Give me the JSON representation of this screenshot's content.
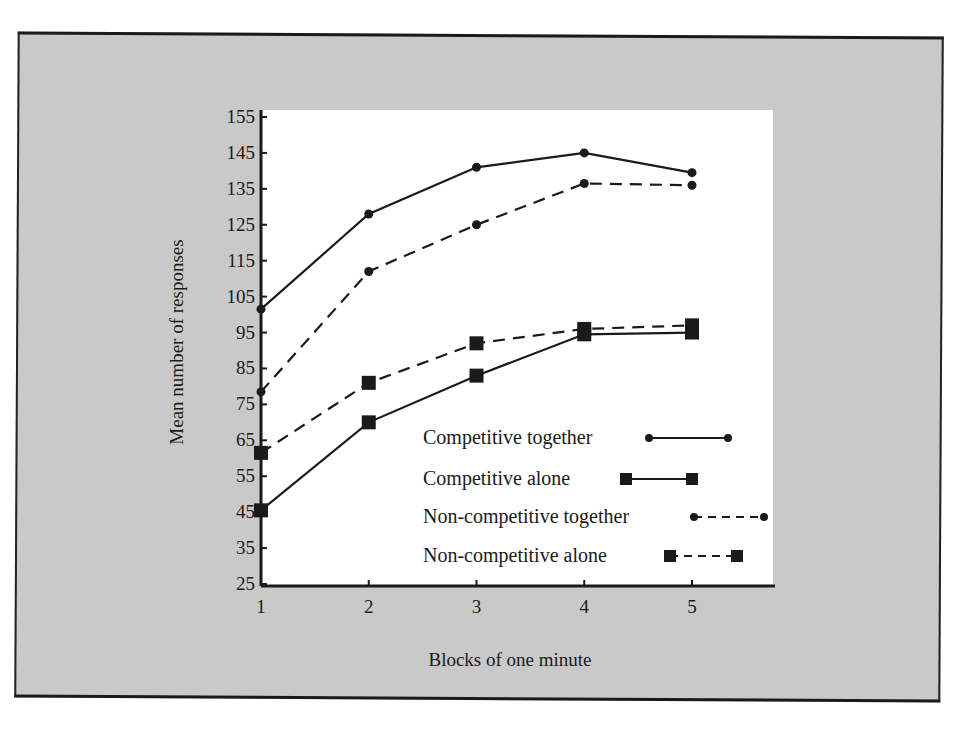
{
  "chart_data": {
    "type": "line",
    "title": "",
    "xlabel": "Blocks of one minute",
    "ylabel": "Mean number of responses",
    "x": [
      1,
      2,
      3,
      4,
      5
    ],
    "x_ticks": [
      "1",
      "2",
      "3",
      "4",
      "5"
    ],
    "y_ticks": [
      "155",
      "145",
      "135",
      "125",
      "115",
      "105",
      "95",
      "85",
      "75",
      "65",
      "55",
      "45",
      "35",
      "25"
    ],
    "ylim": [
      25,
      155
    ],
    "grid": false,
    "legend_position": "lower right inside",
    "series": [
      {
        "name": "Competitive together",
        "marker": "circle",
        "line": "solid",
        "values": [
          101.5,
          128,
          141,
          145,
          139.5
        ]
      },
      {
        "name": "Competitive alone",
        "marker": "square",
        "line": "solid",
        "values": [
          45.5,
          70,
          83,
          94.5,
          95
        ]
      },
      {
        "name": "Non-competitive together",
        "marker": "circle",
        "line": "dashed",
        "values": [
          78.5,
          112,
          125,
          136.5,
          136
        ]
      },
      {
        "name": "Non-competitive alone",
        "marker": "square",
        "line": "dashed",
        "values": [
          61.5,
          81,
          92,
          96,
          97
        ]
      }
    ]
  },
  "colors": {
    "background_panel": "#c9c9c9",
    "plot_area": "#ffffff",
    "ink": "#1a1a1a"
  }
}
